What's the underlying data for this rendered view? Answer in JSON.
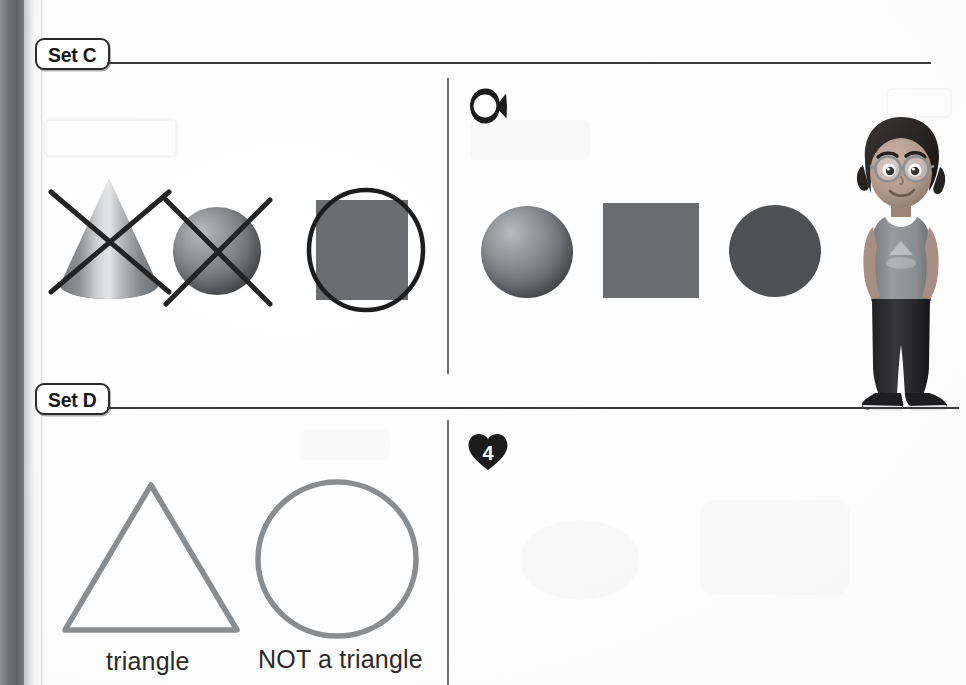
{
  "page": {
    "type": "math-workbook-page",
    "background_color": "#ffffff",
    "ink_color": "#2b2b2b"
  },
  "gutter": {
    "label": "book-spine-shadow",
    "color": "#6f7174"
  },
  "sections": [
    {
      "id": "set-c",
      "badge_label": "Set C",
      "rule": true,
      "question": {
        "number_label": "3",
        "badge_shape": "fish",
        "badge_color": "#1b1b1b"
      },
      "example_shapes": [
        {
          "name": "cone",
          "style": "3d-gradient",
          "marked": "crossed-out",
          "color": "#9b9ea1"
        },
        {
          "name": "sphere",
          "style": "3d-gradient",
          "marked": "crossed-out",
          "color": "#7f8285"
        },
        {
          "name": "square",
          "style": "flat-fill",
          "marked": "circled",
          "color": "#6a6d70"
        }
      ],
      "answer_shapes": [
        {
          "name": "sphere",
          "style": "3d-gradient",
          "marked": "none",
          "color": "#7f8285"
        },
        {
          "name": "square",
          "style": "flat-fill",
          "marked": "none",
          "color": "#6a6d70"
        },
        {
          "name": "circle",
          "style": "flat-fill",
          "marked": "none",
          "color": "#4e5154"
        }
      ]
    },
    {
      "id": "set-d",
      "badge_label": "Set D",
      "rule": true,
      "question": {
        "number_label": "4",
        "badge_shape": "heart",
        "badge_color": "#1b1b1b"
      },
      "example_shapes": [
        {
          "name": "triangle",
          "style": "outline",
          "caption": "triangle",
          "color": "#8a8d90"
        },
        {
          "name": "circle",
          "style": "outline",
          "caption": "NOT a triangle",
          "color": "#8a8d90"
        }
      ],
      "answer_area": {
        "label": "blank-answer-space",
        "content": ""
      }
    }
  ],
  "captions": {
    "triangle": "triangle",
    "not_a_triangle": "NOT a triangle"
  },
  "character": {
    "name": "cartoon-girl-with-glasses",
    "hair_color": "#2e2b2a",
    "skin_color": "#b9a296",
    "shirt_color": "#8f9194",
    "pants_color": "#2c2c2e",
    "shoe_color": "#1f1f21"
  }
}
